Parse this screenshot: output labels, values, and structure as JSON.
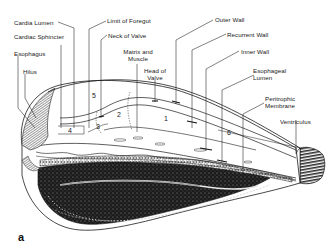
{
  "figure": {
    "panel_label": "a",
    "labels": {
      "cardia_lumen": "Cardia Lumen",
      "limit_of_foregut": "Limit of Foregut",
      "cardiac_sphincter": "Cardiac Sphincter",
      "neck_of_valve": "Neck of Valve",
      "esophagus": "Esophagus",
      "matrix_and_muscle_1": "Matrix and",
      "matrix_and_muscle_2": "Muscle",
      "hilus": "Hilus",
      "head_of_valve_1": "Head of",
      "head_of_valve_2": "Valve",
      "outer_wall": "Outer Wall",
      "recurrent_wall": "Recurrent Wall",
      "inner_wall": "Inner Wall",
      "esophageal_lumen_1": "Esophageal",
      "esophageal_lumen_2": "Lumen",
      "peritrophic_membrane_1": "Peritrophic",
      "peritrophic_membrane_2": "Membrane",
      "ventriculus": "Ventriculus"
    },
    "region_numbers": [
      "1",
      "2",
      "3",
      "4",
      "5",
      "6"
    ],
    "colors": {
      "line": "#1a1a1a",
      "background": "#ffffff",
      "tissue_dark": "#222222"
    }
  }
}
